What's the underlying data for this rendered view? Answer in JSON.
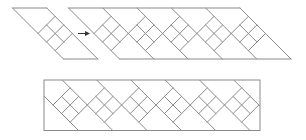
{
  "figure": {
    "stroke_color": "#8a8a8a",
    "stroke_width": 1,
    "background": "#ffffff",
    "diamond_half_size": 17,
    "period": 34.3
  },
  "single_tile": {
    "top_y": 8,
    "bottom_y": 59,
    "center_y": 33.5,
    "first_left_vertex_x": 38,
    "diamond_count": 1
  },
  "arrow": {
    "from": [
      78,
      33.5
    ],
    "to": [
      90,
      33.5
    ],
    "color": "#333333"
  },
  "repeated_strip": {
    "top_y": 8,
    "bottom_y": 59,
    "center_y": 33.5,
    "first_left_vertex_x": 94,
    "diamond_count": 5
  },
  "rectangular_band": {
    "left_x": 44,
    "right_x": 260,
    "top_y": 80,
    "bottom_y": 130.5,
    "center_y": 105,
    "first_left_vertex_x": 53,
    "diamond_count": 6
  }
}
